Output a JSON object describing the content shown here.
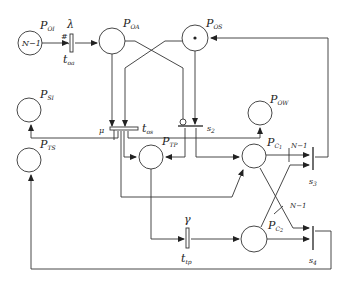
{
  "diagram": {
    "type": "petri-net",
    "places": [
      {
        "id": "P_OI",
        "name": "P",
        "sub": "OI",
        "tokens_label": "N−1"
      },
      {
        "id": "P_OA",
        "name": "P",
        "sub": "OA"
      },
      {
        "id": "P_OS",
        "name": "P",
        "sub": "OS",
        "tokens": 1
      },
      {
        "id": "P_SI",
        "name": "P",
        "sub": "SI"
      },
      {
        "id": "P_OW",
        "name": "P",
        "sub": "OW"
      },
      {
        "id": "P_TS",
        "name": "P",
        "sub": "TS"
      },
      {
        "id": "P_TP",
        "name": "P",
        "sub": "TP"
      },
      {
        "id": "P_C1",
        "name": "P",
        "sub": "C",
        "subsub": "1"
      },
      {
        "id": "P_C2",
        "name": "P",
        "sub": "C",
        "subsub": "2"
      }
    ],
    "transitions": [
      {
        "id": "t_oa",
        "name": "t",
        "sub": "oa",
        "rate": "λ",
        "marking": "#"
      },
      {
        "id": "t_os",
        "name": "t",
        "sub": "os",
        "rate": "μ"
      },
      {
        "id": "s2",
        "name": "s",
        "sub": "2"
      },
      {
        "id": "t_tp",
        "name": "t",
        "sub": "tp",
        "rate": "γ"
      },
      {
        "id": "s3",
        "name": "s",
        "sub": "3"
      },
      {
        "id": "s4",
        "name": "s",
        "sub": "4"
      }
    ],
    "arc_weights": {
      "c1_to_s3": "N−1",
      "c1_to_s4": "N−1"
    },
    "token_symbol": "•"
  }
}
